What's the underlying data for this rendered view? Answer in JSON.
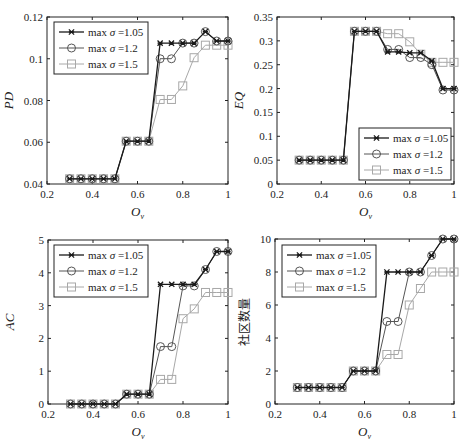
{
  "series_styles": [
    {
      "name": "max σ =1.05",
      "legend_prefix": "max ",
      "legend_sigma": "σ",
      "legend_value": " =1.05",
      "color": "#1a1a1a",
      "marker": "x-star",
      "width": 1.3
    },
    {
      "name": "max σ =1.2",
      "legend_prefix": "max ",
      "legend_sigma": "σ",
      "legend_value": " =1.2",
      "color": "#555555",
      "marker": "circle",
      "width": 1.0
    },
    {
      "name": "max σ =1.5",
      "legend_prefix": "max ",
      "legend_sigma": "σ",
      "legend_value": " =1.5",
      "color": "#a8a8a8",
      "marker": "square",
      "width": 1.0
    }
  ],
  "chart_data": [
    {
      "type": "line",
      "id": "pd",
      "title": "",
      "xlabel": "O_v",
      "ylabel": "PD",
      "xlim": [
        0.2,
        1.0
      ],
      "ylim": [
        0.04,
        0.12
      ],
      "xticks": [
        0.2,
        0.4,
        0.6,
        0.8,
        1
      ],
      "xtick_labels": [
        "0.2",
        "0.4",
        "0.6",
        "0.8",
        "1"
      ],
      "yticks": [
        0.04,
        0.06,
        0.08,
        0.1,
        0.12
      ],
      "ytick_labels": [
        "0.04",
        "0.06",
        "0.08",
        "0.1",
        "0.12"
      ],
      "legend_position": "upper-left",
      "grid": false,
      "x": [
        0.3,
        0.35,
        0.4,
        0.45,
        0.5,
        0.55,
        0.6,
        0.65,
        0.7,
        0.75,
        0.8,
        0.85,
        0.9,
        0.95,
        1.0
      ],
      "series": [
        {
          "name": "max σ =1.05",
          "values": [
            0.0425,
            0.0425,
            0.0425,
            0.0425,
            0.0425,
            0.0605,
            0.0605,
            0.0605,
            0.1075,
            0.1075,
            0.1075,
            0.1075,
            0.113,
            0.1085,
            0.1085
          ]
        },
        {
          "name": "max σ =1.2",
          "values": [
            0.0425,
            0.0425,
            0.0425,
            0.0425,
            0.0425,
            0.0605,
            0.0605,
            0.0605,
            0.1,
            0.1,
            0.1075,
            0.1075,
            0.113,
            0.1085,
            0.1085
          ]
        },
        {
          "name": "max σ =1.5",
          "values": [
            0.0425,
            0.0425,
            0.0425,
            0.0425,
            0.0425,
            0.0605,
            0.0605,
            0.0605,
            0.0805,
            0.0805,
            0.087,
            0.1005,
            0.1065,
            0.1065,
            0.1065
          ]
        }
      ],
      "frame": {
        "left": 47,
        "top": 17,
        "right": 228,
        "bottom": 184
      },
      "legend_box": {
        "x": 54,
        "y": 22,
        "w": 94,
        "h": 52
      }
    },
    {
      "type": "line",
      "id": "eq",
      "title": "",
      "xlabel": "O_v",
      "ylabel": "EQ",
      "xlim": [
        0.2,
        1.0
      ],
      "ylim": [
        0,
        0.35
      ],
      "xticks": [
        0.2,
        0.4,
        0.6,
        0.8,
        1
      ],
      "xtick_labels": [
        "0.2",
        "0.4",
        "0.6",
        "0.8",
        "1"
      ],
      "yticks": [
        0,
        0.05,
        0.1,
        0.15,
        0.2,
        0.25,
        0.3,
        0.35
      ],
      "ytick_labels": [
        "0",
        "0.05",
        "0.1",
        "0.15",
        "0.2",
        "0.25",
        "0.3",
        "0.35"
      ],
      "legend_position": "lower-right",
      "grid": false,
      "x": [
        0.3,
        0.35,
        0.4,
        0.45,
        0.5,
        0.55,
        0.6,
        0.65,
        0.7,
        0.75,
        0.8,
        0.85,
        0.9,
        0.95,
        1.0
      ],
      "series": [
        {
          "name": "max σ =1.05",
          "values": [
            0.05,
            0.05,
            0.05,
            0.05,
            0.05,
            0.32,
            0.32,
            0.32,
            0.277,
            0.277,
            0.275,
            0.275,
            0.258,
            0.2,
            0.2
          ]
        },
        {
          "name": "max σ =1.2",
          "values": [
            0.05,
            0.05,
            0.05,
            0.05,
            0.05,
            0.32,
            0.32,
            0.32,
            0.282,
            0.282,
            0.265,
            0.265,
            0.25,
            0.197,
            0.197
          ]
        },
        {
          "name": "max σ =1.5",
          "values": [
            0.05,
            0.05,
            0.05,
            0.05,
            0.05,
            0.32,
            0.32,
            0.32,
            0.315,
            0.315,
            0.298,
            0.272,
            0.255,
            0.255,
            0.255
          ]
        }
      ],
      "frame": {
        "left": 277,
        "top": 17,
        "right": 454,
        "bottom": 184
      },
      "legend_box": {
        "x": 359,
        "y": 128,
        "w": 92,
        "h": 52
      }
    },
    {
      "type": "line",
      "id": "ac",
      "title": "",
      "xlabel": "O_v",
      "ylabel": "AC",
      "xlim": [
        0.2,
        1.0
      ],
      "ylim": [
        0,
        5
      ],
      "xticks": [
        0.2,
        0.4,
        0.6,
        0.8,
        1
      ],
      "xtick_labels": [
        "0.2",
        "0.4",
        "0.6",
        "0.8",
        "1"
      ],
      "yticks": [
        0,
        1,
        2,
        3,
        4,
        5
      ],
      "ytick_labels": [
        "0",
        "1",
        "2",
        "3",
        "4",
        "5"
      ],
      "legend_position": "upper-left",
      "grid": false,
      "x": [
        0.3,
        0.35,
        0.4,
        0.45,
        0.5,
        0.55,
        0.6,
        0.65,
        0.7,
        0.75,
        0.8,
        0.85,
        0.9,
        0.95,
        1.0
      ],
      "series": [
        {
          "name": "max σ =1.05",
          "values": [
            0,
            0,
            0,
            0,
            0,
            0.3,
            0.3,
            0.3,
            3.65,
            3.65,
            3.65,
            3.65,
            4.1,
            4.65,
            4.65
          ]
        },
        {
          "name": "max σ =1.2",
          "values": [
            0,
            0,
            0,
            0,
            0,
            0.3,
            0.3,
            0.3,
            1.75,
            1.75,
            3.6,
            3.6,
            4.1,
            4.65,
            4.65
          ]
        },
        {
          "name": "max σ =1.5",
          "values": [
            0,
            0,
            0,
            0,
            0,
            0.3,
            0.3,
            0.3,
            0.75,
            0.75,
            2.6,
            2.9,
            3.4,
            3.4,
            3.4
          ]
        }
      ],
      "frame": {
        "left": 48,
        "top": 240,
        "right": 228,
        "bottom": 404
      },
      "legend_box": {
        "x": 54,
        "y": 245,
        "w": 94,
        "h": 52
      }
    },
    {
      "type": "line",
      "id": "community-count",
      "title": "",
      "xlabel": "O_v",
      "ylabel": "社区数量",
      "xlim": [
        0.2,
        1.0
      ],
      "ylim": [
        0,
        10
      ],
      "xticks": [
        0.2,
        0.4,
        0.6,
        0.8,
        1
      ],
      "xtick_labels": [
        "0.2",
        "0.4",
        "0.6",
        "0.8",
        "1"
      ],
      "yticks": [
        0,
        2,
        4,
        6,
        8,
        10
      ],
      "ytick_labels": [
        "0",
        "2",
        "4",
        "6",
        "8",
        "10"
      ],
      "legend_position": "upper-left",
      "grid": false,
      "x": [
        0.3,
        0.35,
        0.4,
        0.45,
        0.5,
        0.55,
        0.6,
        0.65,
        0.7,
        0.75,
        0.8,
        0.85,
        0.9,
        0.95,
        1.0
      ],
      "series": [
        {
          "name": "max σ =1.05",
          "values": [
            1,
            1,
            1,
            1,
            1,
            2,
            2,
            2,
            8,
            8,
            8,
            8,
            9,
            10,
            10
          ]
        },
        {
          "name": "max σ =1.2",
          "values": [
            1,
            1,
            1,
            1,
            1,
            2,
            2,
            2,
            5,
            5,
            8,
            8,
            9,
            10,
            10
          ]
        },
        {
          "name": "max σ =1.5",
          "values": [
            1,
            1,
            1,
            1,
            1,
            2,
            2,
            2,
            3,
            3,
            6,
            7,
            8,
            8,
            8
          ]
        }
      ],
      "frame": {
        "left": 275,
        "top": 239,
        "right": 454,
        "bottom": 404
      },
      "legend_box": {
        "x": 282,
        "y": 245,
        "w": 94,
        "h": 52
      }
    }
  ]
}
